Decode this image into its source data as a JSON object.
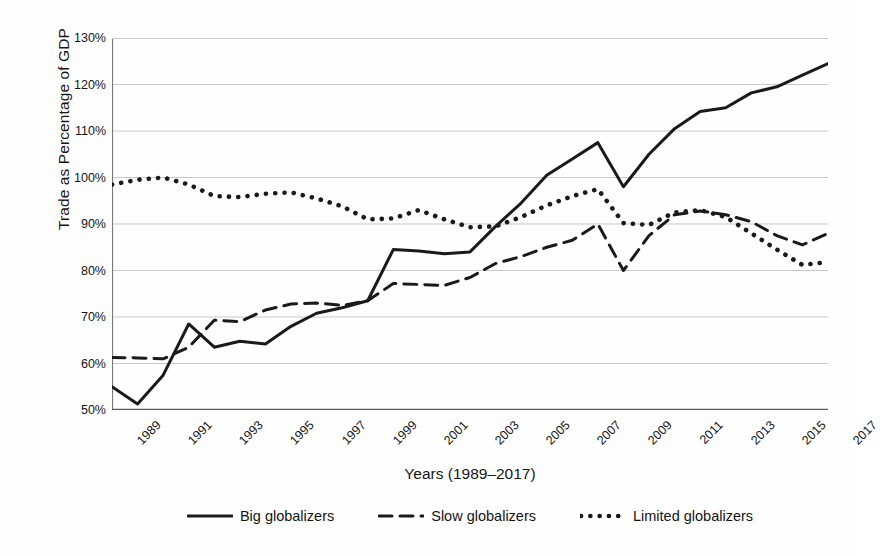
{
  "chart_data": {
    "type": "line",
    "title": "",
    "xlabel": "Years (1989–2017)",
    "ylabel": "Trade as Percentage of GDP",
    "ylim": [
      50,
      130
    ],
    "ytick_labels": [
      "50%",
      "60%",
      "70%",
      "80%",
      "90%",
      "100%",
      "110%",
      "120%",
      "130%"
    ],
    "ytick_values": [
      50,
      60,
      70,
      80,
      90,
      100,
      110,
      120,
      130
    ],
    "grid": "horizontal",
    "legend_position": "bottom",
    "x": [
      1989,
      1990,
      1991,
      1992,
      1993,
      1994,
      1995,
      1996,
      1997,
      1998,
      1999,
      2000,
      2001,
      2002,
      2003,
      2004,
      2005,
      2006,
      2007,
      2008,
      2009,
      2010,
      2011,
      2012,
      2013,
      2014,
      2015,
      2016,
      2017
    ],
    "xtick_labels": [
      "1989",
      "1991",
      "1993",
      "1995",
      "1997",
      "1999",
      "2001",
      "2003",
      "2005",
      "2007",
      "2009",
      "2011",
      "2013",
      "2015",
      "2017"
    ],
    "xtick_values": [
      1989,
      1991,
      1993,
      1995,
      1997,
      1999,
      2001,
      2003,
      2005,
      2007,
      2009,
      2011,
      2013,
      2015,
      2017
    ],
    "series": [
      {
        "name": "Big globalizers",
        "style": "solid",
        "color": "#1a1a1a",
        "values": [
          55.0,
          51.3,
          57.5,
          68.5,
          63.5,
          64.8,
          64.2,
          68.0,
          70.8,
          72.0,
          73.5,
          84.5,
          84.2,
          83.6,
          84.0,
          89.5,
          94.5,
          100.5,
          104.0,
          107.5,
          98.0,
          105.0,
          110.5,
          114.2,
          115.0,
          118.2,
          119.5,
          122.0,
          124.5
        ]
      },
      {
        "name": "Slow globalizers",
        "style": "dashed",
        "color": "#1a1a1a",
        "values": [
          61.3,
          61.2,
          61.0,
          63.5,
          69.3,
          69.0,
          71.5,
          72.8,
          73.0,
          72.5,
          73.5,
          77.2,
          77.0,
          76.8,
          78.5,
          81.5,
          83.0,
          85.0,
          86.5,
          90.0,
          80.0,
          87.5,
          92.0,
          92.8,
          92.0,
          90.5,
          87.5,
          85.5,
          88.0
        ]
      },
      {
        "name": "Limited globalizers",
        "style": "dotted",
        "color": "#1a1a1a",
        "values": [
          98.5,
          99.5,
          100.0,
          98.5,
          96.0,
          95.8,
          96.5,
          96.8,
          95.5,
          93.8,
          91.0,
          91.2,
          93.0,
          91.0,
          89.3,
          89.5,
          91.5,
          94.0,
          96.0,
          97.5,
          90.2,
          89.8,
          92.5,
          93.0,
          91.5,
          88.0,
          84.5,
          81.2,
          81.8
        ]
      }
    ]
  },
  "legend": {
    "items": [
      {
        "label": "Big globalizers",
        "style": "solid"
      },
      {
        "label": "Slow globalizers",
        "style": "dashed"
      },
      {
        "label": "Limited globalizers",
        "style": "dotted"
      }
    ]
  },
  "colors": {
    "ink": "#1a1a1a",
    "grid": "#c9c9c9",
    "axis": "#7a7a7a",
    "background": "#fefefe"
  }
}
